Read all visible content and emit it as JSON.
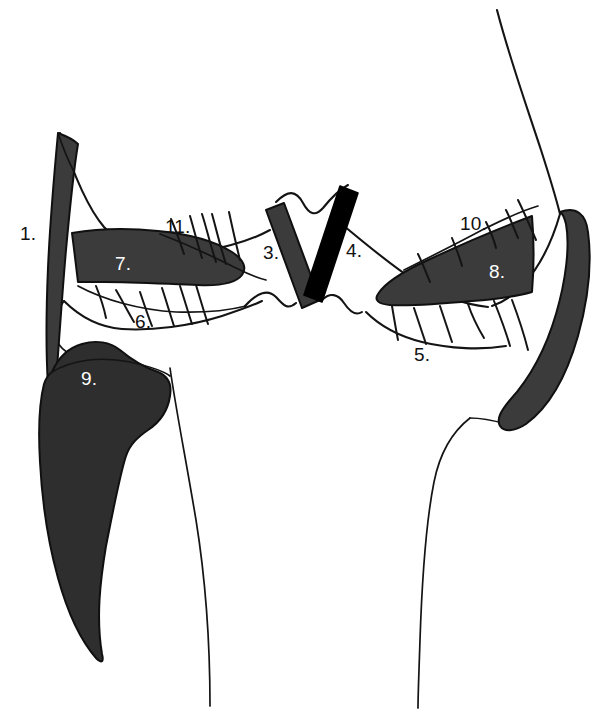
{
  "figure": {
    "background_color": "#ffffff",
    "line_color": "#141414",
    "fill_gray": "#3b3b3b",
    "fill_dark": "#2e2e2e",
    "fill_black": "#000000",
    "label_color_on_light": "#111111",
    "label_color_on_dark": "#ffffff"
  },
  "labels": [
    {
      "id": "1",
      "text": "1.",
      "x": 20,
      "y": 224,
      "on_dark": false
    },
    {
      "id": "2",
      "text": "2.",
      "x": 549,
      "y": 248,
      "on_dark": true
    },
    {
      "id": "3",
      "text": "3.",
      "x": 263,
      "y": 243,
      "on_dark": false
    },
    {
      "id": "4",
      "text": "4.",
      "x": 346,
      "y": 241,
      "on_dark": false
    },
    {
      "id": "5",
      "text": "5.",
      "x": 414,
      "y": 345,
      "on_dark": false
    },
    {
      "id": "6",
      "text": "6.",
      "x": 135,
      "y": 312,
      "on_dark": false
    },
    {
      "id": "7",
      "text": "7.",
      "x": 115,
      "y": 254,
      "on_dark": true
    },
    {
      "id": "8",
      "text": "8.",
      "x": 489,
      "y": 262,
      "on_dark": true
    },
    {
      "id": "9",
      "text": "9.",
      "x": 81,
      "y": 369,
      "on_dark": true
    },
    {
      "id": "10",
      "text": "10.",
      "x": 460,
      "y": 214,
      "on_dark": false
    },
    {
      "id": "11",
      "text": "11.",
      "x": 165,
      "y": 217,
      "on_dark": false
    }
  ],
  "regions": [
    {
      "id": "region-1",
      "label": "1.",
      "name": "left-vertical-blade",
      "fill": "#3b3b3b"
    },
    {
      "id": "region-2",
      "label": "2.",
      "name": "right-curved-blade",
      "fill": "#3b3b3b"
    },
    {
      "id": "region-3",
      "label": "3.",
      "name": "left-v-band",
      "fill": "#3b3b3b"
    },
    {
      "id": "region-4",
      "label": "4.",
      "name": "right-v-band",
      "fill": "#000000"
    },
    {
      "id": "region-5",
      "label": "5.",
      "name": "right-lower-margin-line",
      "fill": "none"
    },
    {
      "id": "region-6",
      "label": "6.",
      "name": "left-lower-margin-line",
      "fill": "none"
    },
    {
      "id": "region-7",
      "label": "7.",
      "name": "left-horizontal-body",
      "fill": "#3b3b3b"
    },
    {
      "id": "region-8",
      "label": "8.",
      "name": "right-horizontal-body",
      "fill": "#3b3b3b"
    },
    {
      "id": "region-9",
      "label": "9.",
      "name": "left-large-mass",
      "fill": "#2e2e2e"
    },
    {
      "id": "region-10",
      "label": "10.",
      "name": "right-upper-margin-line",
      "fill": "none"
    },
    {
      "id": "region-11",
      "label": "11.",
      "name": "left-upper-margin-line",
      "fill": "none"
    }
  ]
}
